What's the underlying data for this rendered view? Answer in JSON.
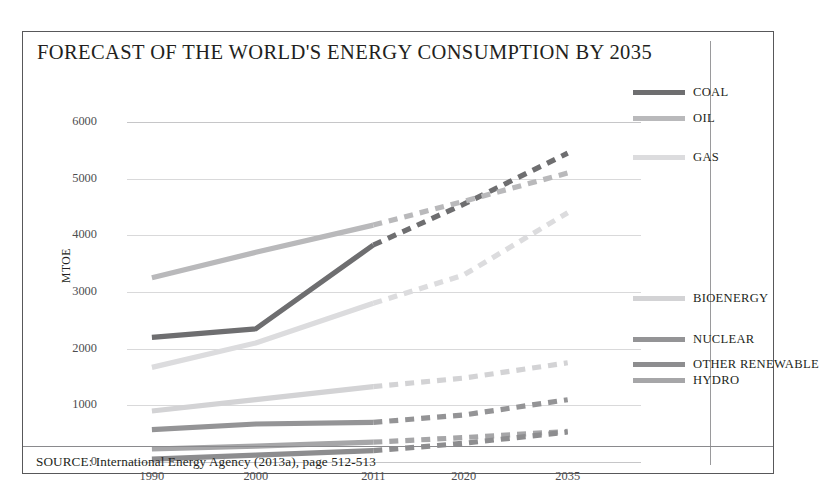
{
  "title": "FORECAST OF THE WORLD'S ENERGY CONSUMPTION BY 2035",
  "source": "SOURCE: International Energy Agency (2013a), page 512-513",
  "axis": {
    "ylabel": "MTOE"
  },
  "legend": [
    {
      "label": "COAL",
      "color": "#6e6e70",
      "top": 50
    },
    {
      "label": "OIL",
      "color": "#b9b9bb",
      "top": 76
    },
    {
      "label": "GAS",
      "color": "#dcdcde",
      "top": 115
    },
    {
      "label": "BIOENERGY",
      "color": "#d3d3d5",
      "top": 256
    },
    {
      "label": "NUCLEAR",
      "color": "#949496",
      "top": 297
    },
    {
      "label": "OTHER RENEWABLE",
      "color": "#8d8d8f",
      "top": 322
    },
    {
      "label": "HYDRO",
      "color": "#a6a6a8",
      "top": 338
    }
  ],
  "chart_data": {
    "type": "line",
    "title": "FORECAST OF THE WORLD'S ENERGY CONSUMPTION BY 2035",
    "xlabel": "",
    "ylabel": "MTOE",
    "categories": [
      "1990",
      "2000",
      "2011",
      "2020",
      "2035"
    ],
    "x": [
      1990,
      2000,
      2011,
      2020,
      2035
    ],
    "ylim": [
      0,
      6000
    ],
    "yticks": [
      0,
      1000,
      2000,
      3000,
      4000,
      5000,
      6000
    ],
    "grid": true,
    "legend_position": "right",
    "annotations": [
      "Solid segments = historical data (1990-2011); dashed segments = forecast (2011-2035)"
    ],
    "forecast_starts_at": "2011",
    "series": [
      {
        "name": "COAL",
        "color": "#6e6e70",
        "values": [
          2200,
          2350,
          3830,
          4550,
          5450
        ]
      },
      {
        "name": "OIL",
        "color": "#b9b9bb",
        "values": [
          3250,
          3700,
          4180,
          4600,
          5100
        ]
      },
      {
        "name": "GAS",
        "color": "#dcdcde",
        "values": [
          1670,
          2100,
          2800,
          3300,
          4400
        ]
      },
      {
        "name": "BIOENERGY",
        "color": "#d3d3d5",
        "values": [
          900,
          1100,
          1330,
          1480,
          1750
        ]
      },
      {
        "name": "NUCLEAR",
        "color": "#949496",
        "values": [
          570,
          670,
          700,
          830,
          1100
        ]
      },
      {
        "name": "HYDRO",
        "color": "#a6a6a8",
        "values": [
          230,
          280,
          350,
          430,
          540
        ]
      },
      {
        "name": "OTHER RENEWABLE",
        "color": "#8d8d8f",
        "values": [
          50,
          120,
          200,
          330,
          530
        ]
      }
    ]
  }
}
